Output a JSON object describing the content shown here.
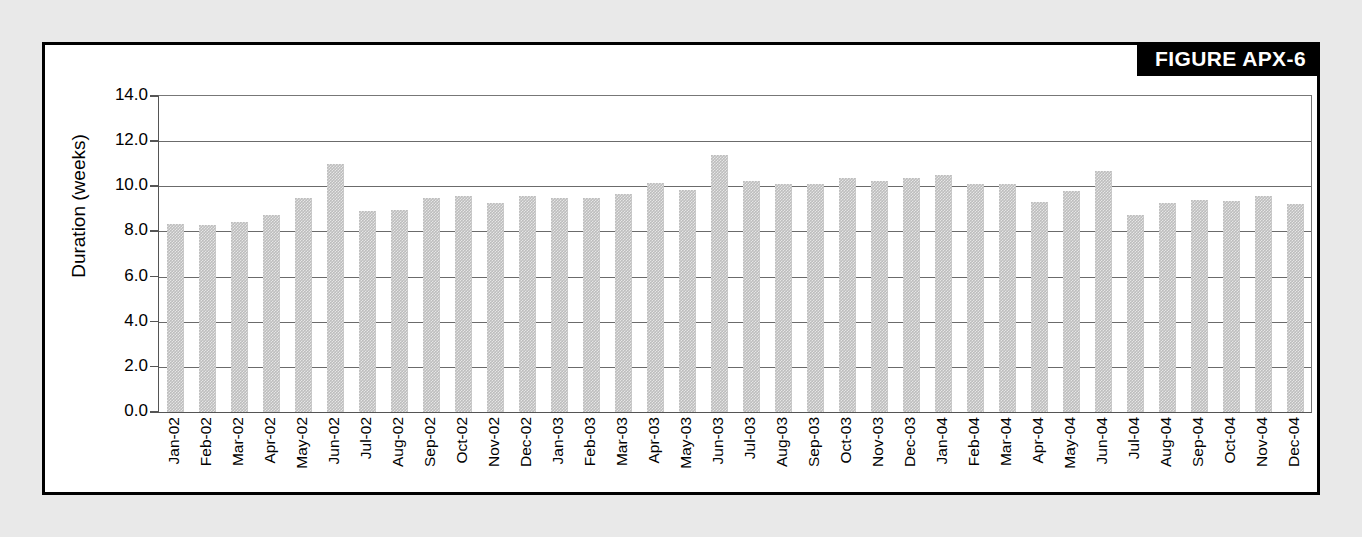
{
  "figure": {
    "banner_label": "FIGURE APX-6"
  },
  "colors": {
    "page_background": "#e9e9e9",
    "panel_background": "#ffffff",
    "panel_border": "#000000",
    "banner_background": "#000000",
    "banner_text": "#ffffff",
    "bar_fill": "#bdbdbd",
    "gridline": "#6b6b6b",
    "axis": "#555555"
  },
  "chart_data": {
    "type": "bar",
    "title": "",
    "xlabel": "",
    "ylabel": "Duration (weeks)",
    "ylim": [
      0.0,
      14.0
    ],
    "ytick_step": 2.0,
    "ytick_labels": [
      "14.0",
      "12.0",
      "10.0",
      "8.0",
      "6.0",
      "4.0",
      "2.0",
      "0.0"
    ],
    "ytick_values": [
      14.0,
      12.0,
      10.0,
      8.0,
      6.0,
      4.0,
      2.0,
      0.0
    ],
    "grid": "horizontal",
    "legend": "none",
    "categories": [
      "Jan-02",
      "Feb-02",
      "Mar-02",
      "Apr-02",
      "May-02",
      "Jun-02",
      "Jul-02",
      "Aug-02",
      "Sep-02",
      "Oct-02",
      "Nov-02",
      "Dec-02",
      "Jan-03",
      "Feb-03",
      "Mar-03",
      "Apr-03",
      "May-03",
      "Jun-03",
      "Jul-03",
      "Aug-03",
      "Sep-03",
      "Oct-03",
      "Nov-03",
      "Dec-03",
      "Jan-04",
      "Feb-04",
      "Mar-04",
      "Apr-04",
      "May-04",
      "Jun-04",
      "Jul-04",
      "Aug-04",
      "Sep-04",
      "Oct-04",
      "Nov-04",
      "Dec-04"
    ],
    "values": [
      8.35,
      8.3,
      8.4,
      8.75,
      9.5,
      11.0,
      8.9,
      8.95,
      9.5,
      9.55,
      9.25,
      9.55,
      9.5,
      9.5,
      9.65,
      10.15,
      9.85,
      11.4,
      10.25,
      10.1,
      10.1,
      10.35,
      10.25,
      10.35,
      10.5,
      10.1,
      10.1,
      9.3,
      9.8,
      10.7,
      8.75,
      9.25,
      9.4,
      9.35,
      9.55,
      9.2
    ]
  }
}
